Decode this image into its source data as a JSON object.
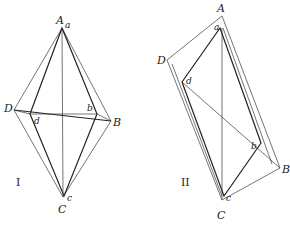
{
  "figures": [
    {
      "id": "I",
      "label": "I",
      "outer": {
        "A": [
          62,
          28
        ],
        "B": [
          111,
          121
        ],
        "C": [
          63,
          197
        ],
        "D": [
          14,
          110
        ]
      },
      "inner": {
        "a": [
          62,
          28
        ],
        "b": [
          97,
          114
        ],
        "c": [
          64,
          196
        ],
        "d": [
          30,
          114
        ]
      },
      "labels": {
        "A": "A",
        "B": "B",
        "C": "C",
        "D": "D",
        "a": "a",
        "b": "b",
        "c": "c",
        "d": "d"
      }
    },
    {
      "id": "II",
      "label": "II",
      "outer": {
        "A": [
          222,
          16
        ],
        "B": [
          280,
          168
        ],
        "C": [
          222,
          200
        ],
        "D": [
          167,
          60
        ]
      },
      "inner": {
        "a": [
          220,
          28
        ],
        "b": [
          261,
          143
        ],
        "c": [
          224,
          196
        ],
        "d": [
          182,
          82
        ]
      },
      "labels": {
        "A": "A",
        "B": "B",
        "C": "C",
        "D": "D",
        "a": "a",
        "b": "b",
        "c": "c",
        "d": "d"
      }
    }
  ],
  "colors": {
    "stroke": "#222222",
    "background": "#ffffff"
  }
}
